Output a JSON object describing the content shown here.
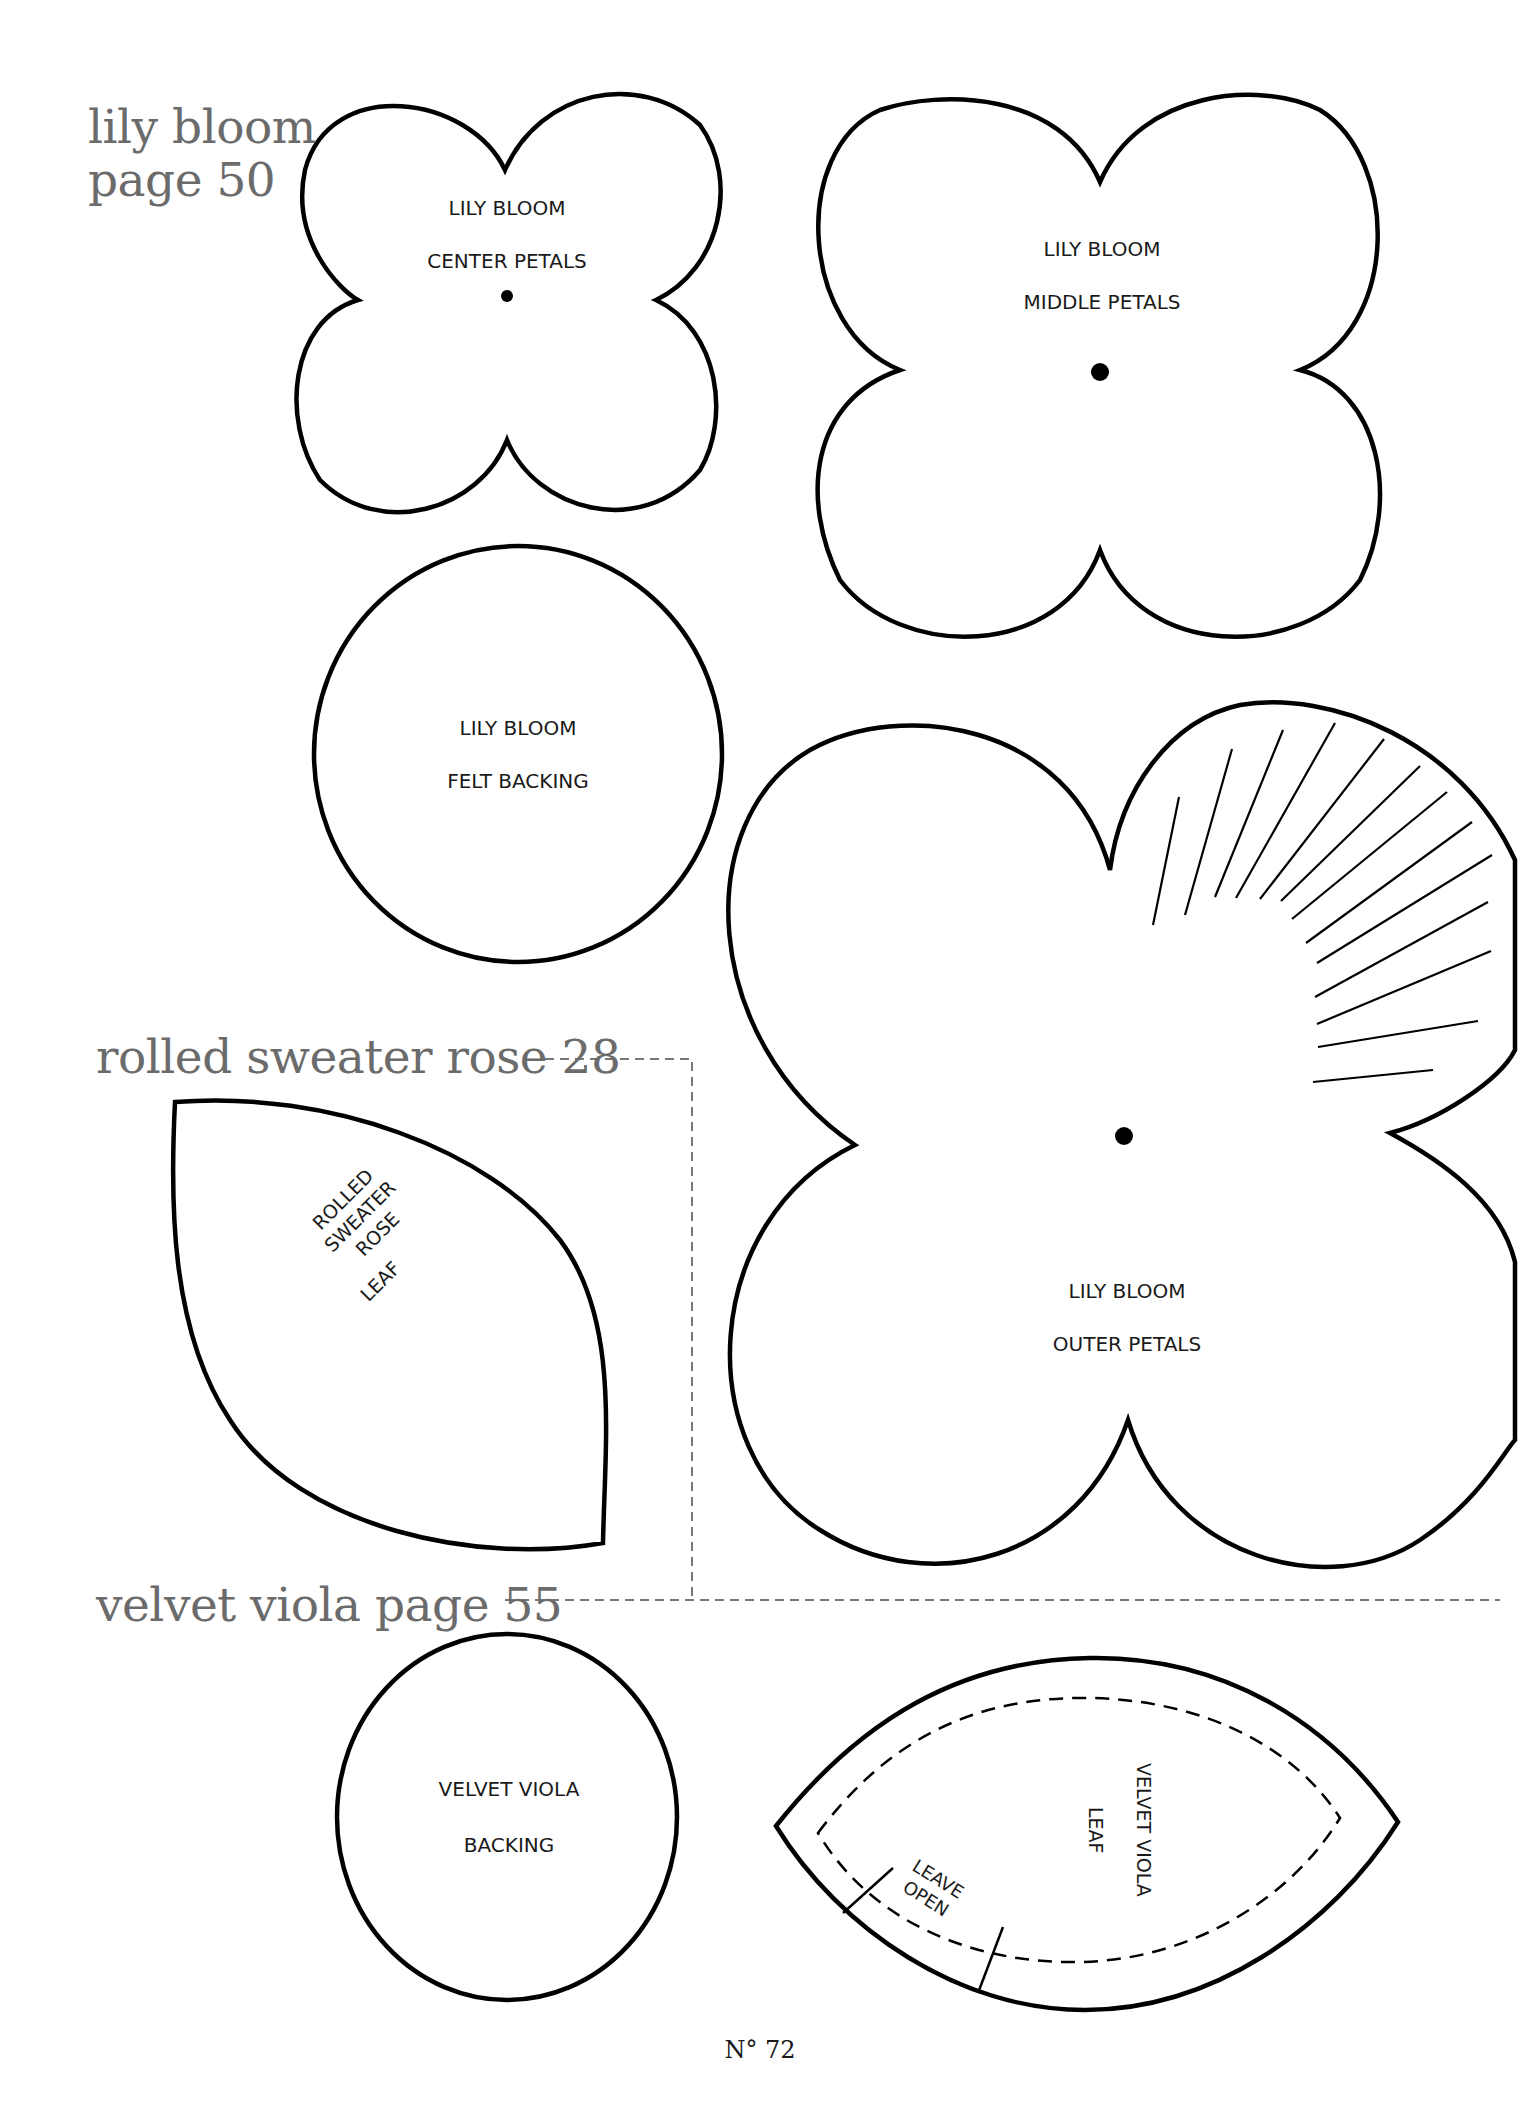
{
  "sections": {
    "lily_bloom": {
      "heading_line1": "lily bloom",
      "heading_line2": "page 50"
    },
    "rolled_sweater_rose": {
      "heading": "rolled sweater rose 28"
    },
    "velvet_viola": {
      "heading": "velvet viola page 55"
    }
  },
  "templates": {
    "lily_center": {
      "title": "LILY BLOOM",
      "subtitle": "CENTER PETALS"
    },
    "lily_middle": {
      "title": "LILY BLOOM",
      "subtitle": "MIDDLE PETALS"
    },
    "lily_felt": {
      "title": "LILY BLOOM",
      "subtitle": "FELT BACKING"
    },
    "lily_outer": {
      "title": "LILY BLOOM",
      "subtitle": "OUTER PETALS"
    },
    "rose_leaf": {
      "line1": "ROLLED",
      "line2": "SWEATER",
      "line3": "ROSE",
      "line4": "LEAF"
    },
    "viola_backing": {
      "title": "VELVET VIOLA",
      "subtitle": "BACKING"
    },
    "viola_leaf": {
      "title": "VELVET VIOLA",
      "subtitle": "LEAF",
      "note_line1": "LEAVE",
      "note_line2": "OPEN"
    }
  },
  "footer": {
    "page_number": "N° 72"
  },
  "colors": {
    "outline": "#000000",
    "heading": "#6b6b6b",
    "divider": "#777777"
  }
}
